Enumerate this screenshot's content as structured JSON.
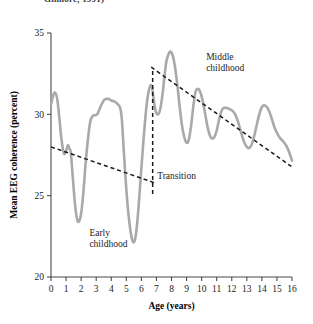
{
  "figure": {
    "cropped_caption": "Gilmore, 1991)",
    "background_color": "#ffffff"
  },
  "chart_data": {
    "type": "line",
    "title": "",
    "xlabel": "Age (years)",
    "ylabel": "Mean EEG coherence (percent)",
    "xlim": [
      0,
      16
    ],
    "ylim": [
      20,
      35
    ],
    "grid": false,
    "legend_position": "none",
    "xticks": [
      0,
      1,
      2,
      3,
      4,
      5,
      6,
      7,
      8,
      9,
      10,
      11,
      12,
      13,
      14,
      15,
      16
    ],
    "xtick_labels": [
      "0",
      "1",
      "2",
      "3",
      "4",
      "5",
      "6",
      "7",
      "8",
      "9",
      "10",
      "11",
      "12",
      "13",
      "14",
      "15",
      "16"
    ],
    "yticks": [
      20,
      25,
      30,
      35
    ],
    "ytick_labels": [
      "20",
      "25",
      "30",
      "35"
    ],
    "series": [
      {
        "name": "Mean EEG coherence",
        "color": "#a9a9a9",
        "line_width": 2.6,
        "x": [
          0.0,
          0.2,
          0.38,
          0.52,
          0.68,
          0.85,
          1.0,
          1.12,
          1.22,
          1.32,
          1.45,
          1.58,
          1.72,
          1.85,
          2.0,
          2.15,
          2.3,
          2.48,
          2.62,
          2.78,
          2.95,
          3.1,
          3.3,
          3.55,
          3.8,
          4.0,
          4.2,
          4.35,
          4.5,
          4.62,
          4.72,
          4.85,
          5.0,
          5.15,
          5.3,
          5.45,
          5.6,
          5.75,
          5.9,
          6.05,
          6.2,
          6.35,
          6.5,
          6.62,
          6.72,
          6.82,
          6.95,
          7.1,
          7.25,
          7.4,
          7.52,
          7.65,
          7.8,
          7.95,
          8.1,
          8.25,
          8.4,
          8.55,
          8.7,
          8.85,
          9.0,
          9.15,
          9.3,
          9.45,
          9.6,
          9.8,
          10.0,
          10.2,
          10.4,
          10.6,
          10.8,
          11.0,
          11.2,
          11.4,
          11.6,
          11.8,
          12.0,
          12.2,
          12.4,
          12.6,
          12.8,
          13.0,
          13.2,
          13.4,
          13.6,
          13.8,
          14.0,
          14.2,
          14.4,
          14.6,
          14.8,
          15.0,
          15.2,
          15.4,
          15.6,
          15.8,
          16.0
        ],
        "y": [
          30.6,
          31.3,
          31.1,
          30.1,
          28.6,
          27.6,
          27.75,
          28.1,
          27.9,
          27.6,
          26.1,
          24.6,
          23.6,
          23.4,
          23.9,
          25.2,
          27.0,
          28.7,
          29.6,
          29.9,
          29.95,
          30.05,
          30.5,
          30.9,
          30.95,
          30.85,
          30.8,
          30.7,
          30.55,
          30.3,
          29.5,
          27.5,
          25.4,
          23.8,
          22.7,
          22.15,
          22.4,
          23.6,
          25.4,
          27.3,
          29.1,
          30.6,
          31.5,
          31.8,
          31.6,
          30.9,
          30.2,
          30.0,
          30.3,
          31.2,
          32.2,
          33.2,
          33.7,
          33.85,
          33.55,
          32.8,
          31.7,
          30.4,
          29.3,
          28.6,
          28.25,
          28.45,
          29.3,
          30.5,
          31.4,
          31.55,
          31.1,
          30.2,
          29.2,
          28.6,
          28.55,
          29.0,
          29.85,
          30.35,
          30.4,
          30.35,
          30.25,
          30.05,
          29.6,
          28.95,
          28.35,
          28.0,
          27.95,
          28.35,
          29.1,
          29.9,
          30.45,
          30.55,
          30.35,
          29.9,
          29.3,
          28.85,
          28.55,
          28.35,
          28.1,
          27.7,
          27.15
        ]
      }
    ],
    "trend_lines": [
      {
        "name": "early-childhood-trend",
        "style": "dashed",
        "color": "#1a1a1a",
        "x": [
          0.0,
          6.85
        ],
        "y": [
          28.0,
          25.8
        ]
      },
      {
        "name": "middle-childhood-trend",
        "style": "dashed",
        "color": "#1a1a1a",
        "x": [
          6.65,
          15.95
        ],
        "y": [
          32.9,
          26.8
        ]
      }
    ],
    "vertical_markers": [
      {
        "name": "transition-divider",
        "style": "dashed",
        "color": "#1a1a1a",
        "x": 6.75,
        "y_from": 25.1,
        "y_to": 32.7
      }
    ],
    "annotations": [
      {
        "name": "early-childhood",
        "text_line1": "Early",
        "text_line2": "childhood",
        "x": 2.55,
        "y": 22.55
      },
      {
        "name": "transition",
        "text_line1": "Transition",
        "text_line2": "",
        "x": 7.05,
        "y": 26.05
      },
      {
        "name": "middle-childhood",
        "text_line1": "Middle",
        "text_line2": "childhood",
        "x": 10.3,
        "y": 33.35
      }
    ]
  }
}
